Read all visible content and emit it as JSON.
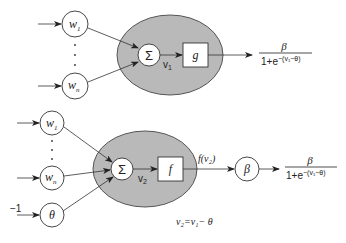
{
  "top_neuron": {
    "inputs": [
      {
        "label": "w",
        "sub": "1"
      },
      {
        "label": "w",
        "sub": "n"
      }
    ],
    "ellipsis": "· · ·",
    "sum_symbol": "Σ",
    "sum_output": {
      "label": "v",
      "sub": "1"
    },
    "activation": "g",
    "output_formula": {
      "numerator": "β",
      "denominator": "1+e",
      "exponent": "−(v₁−θ)"
    }
  },
  "bottom_neuron": {
    "inputs": [
      {
        "label": "w",
        "sub": "1"
      },
      {
        "label": "w",
        "sub": "n"
      },
      {
        "label": "θ",
        "sub": ""
      }
    ],
    "bias_input": "−1",
    "sum_symbol": "Σ",
    "sum_output": {
      "label": "v",
      "sub": "2"
    },
    "activation": "f",
    "activation_output": "f(v₂)",
    "scale_node": "β",
    "output_formula": {
      "numerator": "β",
      "denominator": "1+e",
      "exponent": "−(v₁−θ)"
    },
    "equation": "v₂=v₁− θ"
  },
  "colors": {
    "ellipse_fill": "#b9b9b9",
    "stroke": "#333333",
    "background": "#ffffff"
  }
}
